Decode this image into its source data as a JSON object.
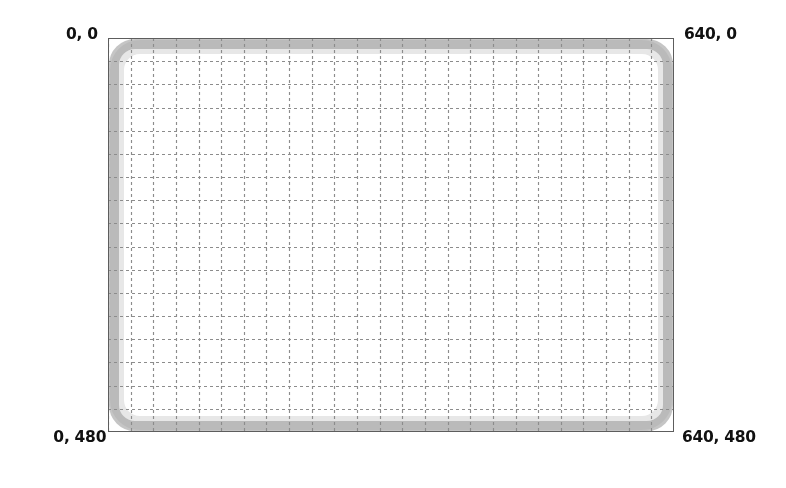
{
  "image": {
    "kind": "screen-coordinate-reference",
    "width_px": 786,
    "height_px": 488
  },
  "screen": {
    "label": "Screen coordinate reference grid",
    "resolution_width": 640,
    "resolution_height": 480,
    "origin_label": "0, 0"
  },
  "corner_labels": {
    "top_left": "0, 0",
    "top_right": "640, 0",
    "bottom_left": "0, 480",
    "bottom_right": "640, 480"
  },
  "grid": {
    "columns": 25,
    "rows": 17,
    "line_style": "dashed",
    "line_color": "#8c8c8c",
    "spacing_x_px": 22.64,
    "spacing_y_px": 23.18,
    "dash_pattern": "3 3"
  },
  "frame": {
    "outline_color": "#5d5d5d",
    "bezel_color": "#969696",
    "bezel_soft_color": "#b0b0b0",
    "corner_radius_px": 26,
    "background": "#ffffff"
  },
  "colors": {
    "page_background": "#ffffff",
    "text": "#111111",
    "grid_line": "#8c8c8c",
    "frame_line": "#5d5d5d",
    "bezel": "#969696"
  }
}
